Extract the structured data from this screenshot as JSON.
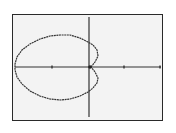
{
  "calculator_screen": {
    "type": "polar graph",
    "background_color": "#f3f3f3",
    "border_color": "#2a2a2a",
    "ink_color": "#333333"
  },
  "chart_data": {
    "type": "line",
    "title": "",
    "xlabel": "",
    "ylabel": "",
    "grid": false,
    "axes": {
      "x_axis_pixel_y": 67,
      "y_axis_pixel_x": 89,
      "x_ticks_pixel_x": [
        52,
        124,
        160
      ],
      "y_axis_range_pixels": [
        17,
        117
      ],
      "x_axis_range_pixels": [
        15,
        161
      ]
    },
    "curve_description": "Polar limaçon-like curve: large loop to the left of origin with a dimpled right side forming two small bulges meeting at the origin",
    "curve_points_pixels": [
      [
        91,
        67
      ],
      [
        95,
        62
      ],
      [
        98,
        56
      ],
      [
        97,
        50
      ],
      [
        93,
        45
      ],
      [
        88,
        42
      ],
      [
        80,
        38
      ],
      [
        70,
        35
      ],
      [
        60,
        35
      ],
      [
        50,
        36
      ],
      [
        40,
        39
      ],
      [
        30,
        44
      ],
      [
        22,
        50
      ],
      [
        17,
        57
      ],
      [
        15,
        64
      ],
      [
        15,
        70
      ],
      [
        17,
        77
      ],
      [
        22,
        84
      ],
      [
        30,
        91
      ],
      [
        40,
        96
      ],
      [
        50,
        99
      ],
      [
        60,
        100
      ],
      [
        70,
        99
      ],
      [
        80,
        96
      ],
      [
        88,
        92
      ],
      [
        93,
        88
      ],
      [
        97,
        83
      ],
      [
        98,
        78
      ],
      [
        95,
        72
      ],
      [
        91,
        67
      ]
    ]
  }
}
